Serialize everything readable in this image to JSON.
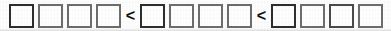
{
  "worksheet": {
    "type": "comparison-exercise",
    "description": "Row of empty answer boxes separated by less-than comparison signs",
    "box_count": 12,
    "group_count": 3,
    "boxes_per_group": 4,
    "empty_box_value": "",
    "box_placeholder": "",
    "operators": [
      "<",
      "<"
    ],
    "operator_name": "less-than-sign",
    "groups": [
      {
        "index": 1,
        "boxes": [
          {
            "value": "",
            "stroke": "dark"
          },
          {
            "value": "",
            "stroke": "gray"
          },
          {
            "value": "",
            "stroke": "gray"
          },
          {
            "value": "",
            "stroke": "gray"
          }
        ]
      },
      {
        "index": 2,
        "boxes": [
          {
            "value": "",
            "stroke": "dark"
          },
          {
            "value": "",
            "stroke": "gray"
          },
          {
            "value": "",
            "stroke": "gray"
          },
          {
            "value": "",
            "stroke": "gray"
          }
        ]
      },
      {
        "index": 3,
        "boxes": [
          {
            "value": "",
            "stroke": "dark"
          },
          {
            "value": "",
            "stroke": "gray"
          },
          {
            "value": "",
            "stroke": "mid"
          },
          {
            "value": "",
            "stroke": "gray"
          }
        ]
      }
    ],
    "colors": {
      "paper": "#fdfdfd",
      "box_stroke_dark": "#2e2e2e",
      "box_stroke_gray": "#6d6d6d",
      "box_fill": "#fefefe",
      "operator": "#111111"
    }
  }
}
